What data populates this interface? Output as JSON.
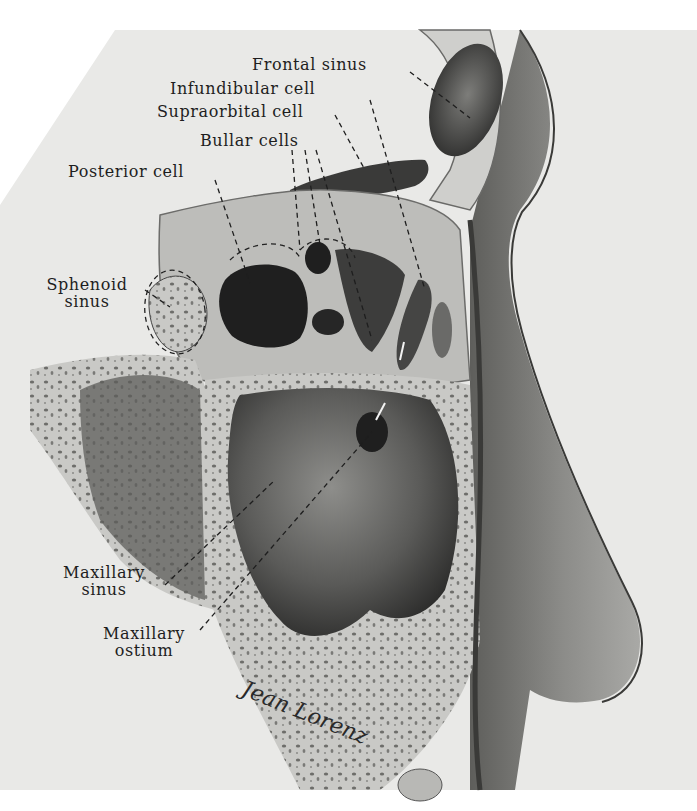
{
  "figure": {
    "type": "anatomical illustration",
    "view": "sagittal section of nasal cavity lateral wall",
    "signature": "Jean Lorenz"
  },
  "labels": [
    {
      "id": "frontal-sinus",
      "text": "Frontal sinus"
    },
    {
      "id": "infundibular-cell",
      "text": "Infundibular cell"
    },
    {
      "id": "supraorbital-cell",
      "text": "Supraorbital cell"
    },
    {
      "id": "bullar-cells",
      "text": "Bullar cells"
    },
    {
      "id": "posterior-cell",
      "text": "Posterior cell"
    },
    {
      "id": "sphenoid-sinus",
      "line1": "Sphenoid",
      "line2": "sinus"
    },
    {
      "id": "maxillary-sinus",
      "line1": "Maxillary",
      "line2": "sinus"
    },
    {
      "id": "maxillary-ostium",
      "line1": "Maxillary",
      "line2": "ostium"
    }
  ],
  "colors": {
    "paper": "#e9e9e7",
    "bone": "#d9d9d6",
    "soft_tissue": "#8f8f8c",
    "cavity_dark": "#262626",
    "cavity_mid": "#555555",
    "ink": "#1e1e1e"
  }
}
